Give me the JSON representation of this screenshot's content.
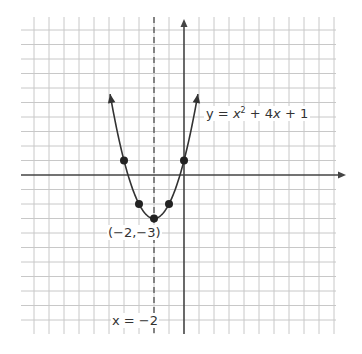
{
  "chart_data": {
    "type": "line",
    "title": "",
    "function": "y = x^2 + 4x + 1",
    "equation_label": {
      "y": "y",
      "eq": " = ",
      "x1": "x",
      "sup": "2",
      "rest": " + 4",
      "x2": "x",
      "tail": " + 1"
    },
    "vertex_label": "(−2,−3)",
    "axis_of_symmetry_label": "x = −2",
    "axis_of_symmetry": -2,
    "points": [
      {
        "x": -4,
        "y": 1
      },
      {
        "x": -3,
        "y": -2
      },
      {
        "x": -2,
        "y": -3
      },
      {
        "x": -1,
        "y": -2
      },
      {
        "x": 0,
        "y": 1
      }
    ],
    "curve_x_range": [
      -4.93,
      0.93
    ],
    "xlim": [
      -10.9,
      10.8
    ],
    "ylim": [
      -10.9,
      10.7
    ],
    "grid": true,
    "xlabel": "",
    "ylabel": "",
    "colors": {
      "grid": "#c8c8c8",
      "axis": "#444444",
      "curve": "#333333",
      "point": "#222222",
      "dash": "#444444"
    }
  }
}
